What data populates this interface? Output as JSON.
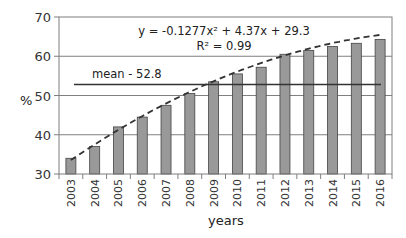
{
  "chart_data": {
    "type": "bar",
    "title": "",
    "xlabel": "years",
    "ylabel": "%",
    "ylim": [
      30,
      70
    ],
    "yticks": [
      30,
      40,
      50,
      60,
      70
    ],
    "grid": true,
    "categories": [
      "2003",
      "2004",
      "2005",
      "2006",
      "2007",
      "2008",
      "2009",
      "2010",
      "2011",
      "2012",
      "2013",
      "2014",
      "2015",
      "2016"
    ],
    "values": [
      34,
      37,
      42,
      44.5,
      47.5,
      50.5,
      53.5,
      55.5,
      57.2,
      60.5,
      61.5,
      62.5,
      63.3,
      64.3
    ],
    "bar_color": "#999999",
    "trendline": {
      "type": "polynomial",
      "style": "dashed",
      "equation": "y = -0.1277x² + 4.37x + 29.3",
      "r_squared_label": "R² = 0.99",
      "coefficients": {
        "a": -0.1277,
        "b": 4.37,
        "c": 29.3
      }
    },
    "mean_line": {
      "value": 52.8,
      "label": "mean - 52.8"
    }
  }
}
